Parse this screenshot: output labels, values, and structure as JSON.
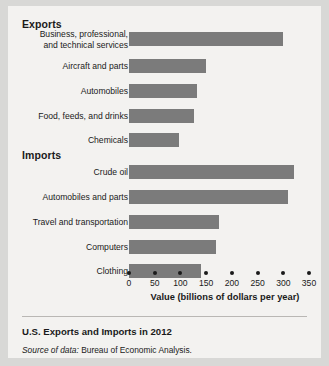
{
  "figure": {
    "caption": "U.S. Exports and Imports in 2012",
    "source_prefix": "Source of data:",
    "source_text": "Bureau of Economic Analysis.",
    "bar_color": "#7b7b7b",
    "text_color": "#1a1a1a",
    "background": "#f3f2f0"
  },
  "chart_data": {
    "type": "bar",
    "orientation": "horizontal",
    "title": "U.S. Exports and Imports in 2012",
    "xlabel": "Value (billions of dollars per year)",
    "ylabel": "",
    "xlim": [
      0,
      350
    ],
    "xticks": [
      0,
      50,
      100,
      150,
      200,
      250,
      300,
      350
    ],
    "grid": false,
    "legend": false,
    "units": "billions of dollars per year",
    "groups": [
      {
        "name": "Exports",
        "categories": [
          "Business, professional,\nand technical services",
          "Aircraft and parts",
          "Automobiles",
          "Food, feeds, and drinks",
          "Chemicals"
        ],
        "values": [
          300,
          150,
          133,
          127,
          97
        ]
      },
      {
        "name": "Imports",
        "categories": [
          "Crude oil",
          "Automobiles and parts",
          "Travel and transportation",
          "Computers",
          "Clothing"
        ],
        "values": [
          320,
          310,
          175,
          170,
          140
        ]
      }
    ]
  }
}
